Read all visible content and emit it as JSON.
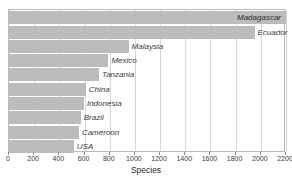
{
  "chart_data": {
    "type": "bar",
    "orientation": "horizontal",
    "title": "",
    "xlabel": "Species",
    "ylabel": "",
    "xlim": [
      0,
      2200
    ],
    "xticks": [
      0,
      200,
      400,
      600,
      800,
      1000,
      1200,
      1400,
      1600,
      1800,
      2000,
      2200
    ],
    "grid": true,
    "legend": "none",
    "bar_color": "#bcbcbc",
    "categories": [
      "Madagascar",
      "Ecuador",
      "Malaysia",
      "Mexico",
      "Tanzania",
      "China",
      "Indonesia",
      "Brazil",
      "Cameroon",
      "USA"
    ],
    "values": [
      2200,
      1950,
      950,
      790,
      715,
      610,
      595,
      570,
      555,
      515
    ],
    "bars": [
      {
        "label": "Madagascar",
        "value": 2200,
        "label_position": "inside"
      },
      {
        "label": "Ecuador",
        "value": 1950,
        "label_position": "outside"
      },
      {
        "label": "Malaysia",
        "value": 950,
        "label_position": "outside"
      },
      {
        "label": "Mexico",
        "value": 790,
        "label_position": "outside"
      },
      {
        "label": "Tanzania",
        "value": 715,
        "label_position": "outside"
      },
      {
        "label": "China",
        "value": 610,
        "label_position": "outside"
      },
      {
        "label": "Indonesia",
        "value": 595,
        "label_position": "outside"
      },
      {
        "label": "Brazil",
        "value": 570,
        "label_position": "outside"
      },
      {
        "label": "Cameroon",
        "value": 555,
        "label_position": "outside"
      },
      {
        "label": "USA",
        "value": 515,
        "label_position": "outside"
      }
    ]
  }
}
